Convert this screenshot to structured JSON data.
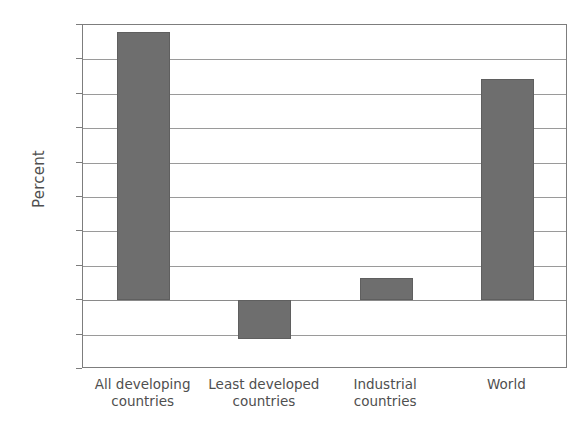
{
  "chart_data": {
    "type": "bar",
    "title": "",
    "subtitle": "",
    "xlabel": "",
    "ylabel": "Percent",
    "categories": [
      "All developing\ncountries",
      "Least developed\ncountries",
      "Industrial\ncountries",
      "World"
    ],
    "category_labels_flat": [
      "All developing countries",
      "Least developed countries",
      "Industrial countries",
      "World"
    ],
    "values": [
      39.0,
      -5.7,
      3.2,
      32.1
    ],
    "ylim": [
      -10,
      40
    ],
    "yticks": [
      40,
      35,
      30,
      25,
      20,
      15,
      10,
      5,
      0,
      -5,
      -10
    ],
    "ytick_labels": [
      "40",
      "35",
      "30",
      "25",
      "20",
      "15",
      "10",
      "5",
      "0",
      "−5",
      "−10"
    ],
    "grid": true,
    "grid_axis": "y",
    "legend": false,
    "legend_position": "none",
    "bar_color": "#6e6e6e",
    "grid_color": "#9a9a9a",
    "axis_color": "#7d7d7d",
    "background_color": "#ffffff",
    "text_color": "#4f4f4f"
  }
}
